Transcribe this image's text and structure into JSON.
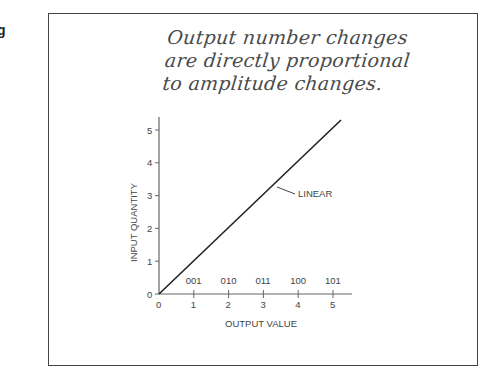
{
  "edge_text": "g",
  "chart_data": {
    "type": "line",
    "title": "",
    "annotation_lines": [
      "Output number changes",
      "are directly proportional",
      "to amplitude changes."
    ],
    "xlabel": "OUTPUT VALUE",
    "ylabel": "INPUT QUANTITY",
    "x_ticks": [
      "0",
      "1",
      "2",
      "3",
      "4",
      "5"
    ],
    "y_ticks": [
      "0",
      "1",
      "2",
      "3",
      "4",
      "5"
    ],
    "binary_codes": [
      "001",
      "010",
      "011",
      "100",
      "101"
    ],
    "xlim": [
      0,
      5.5
    ],
    "ylim": [
      0,
      5.4
    ],
    "grid": false,
    "series": [
      {
        "name": "LINEAR",
        "x": [
          0,
          1,
          2,
          3,
          4,
          5,
          5.2
        ],
        "y": [
          0,
          1,
          2,
          3,
          4,
          5,
          5.2
        ]
      }
    ],
    "series_label": "LINEAR",
    "colors": {
      "line": "#222222",
      "axis": "#555555",
      "text": "#444444"
    }
  }
}
